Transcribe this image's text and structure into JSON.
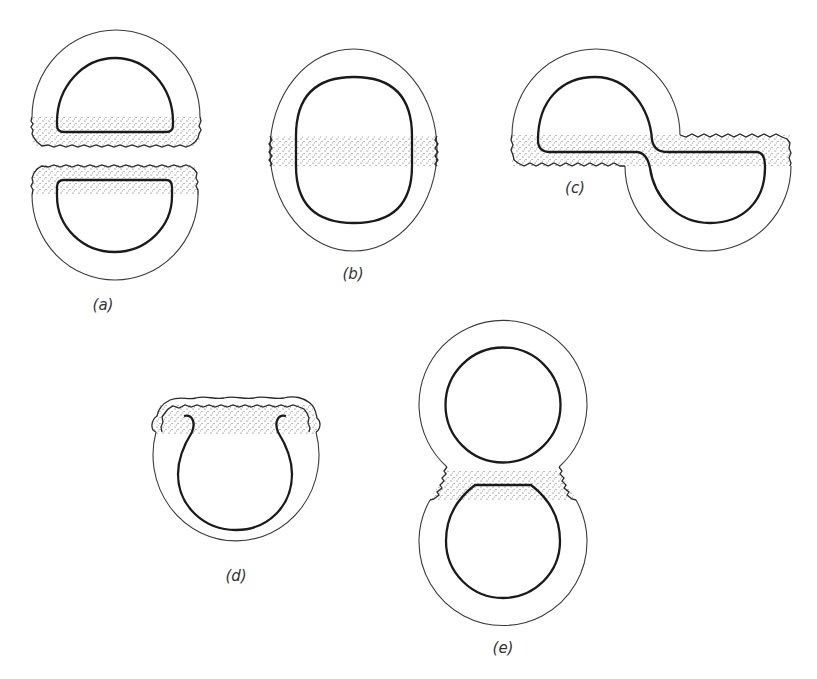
{
  "figure": {
    "panels": [
      {
        "id": "a",
        "label": "(a)",
        "description": "Two separated hemispherical halves, each with dotted wavy-edged band at the cut face"
      },
      {
        "id": "b",
        "label": "(b)",
        "description": "Oval shape with horizontal dotted band across the middle"
      },
      {
        "id": "c",
        "label": "(c)",
        "description": "Two offset halves joined by a horizontal dotted band forming an S shape"
      },
      {
        "id": "d",
        "label": "(d)",
        "description": "Horseshoe shaped inner cavity opening upward into a dotted ruffled band"
      },
      {
        "id": "e",
        "label": "(e)",
        "description": "Figure-eight with two round cavities connected at a dotted neck"
      }
    ]
  },
  "colors": {
    "background": "#ffffff",
    "line": "#1a1a1a",
    "stipple": "#555555"
  }
}
